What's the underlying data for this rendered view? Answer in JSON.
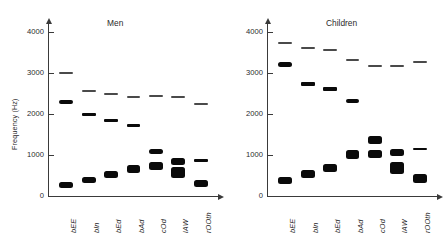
{
  "figure": {
    "ylabel": "Frequency (Hz)",
    "yticks": [
      "0",
      "1000",
      "2000",
      "3000",
      "4000"
    ],
    "ytick_values": [
      0,
      1000,
      2000,
      3000,
      4000
    ],
    "ymin": 0,
    "ymax": 4000,
    "categories": [
      "bEE",
      "bIn",
      "bEd",
      "bAd",
      "cOd",
      "lAW",
      "rOOth"
    ],
    "panels": [
      {
        "title": "Men"
      },
      {
        "title": "Children"
      }
    ]
  },
  "chart_data": {
    "type": "bar",
    "xlabel": "",
    "ylabel": "Frequency (Hz)",
    "ylim": [
      0,
      4000
    ],
    "grid": false,
    "legend": "none",
    "categories": [
      "bEE",
      "bIn",
      "bEd",
      "bAd",
      "cOd",
      "lAW",
      "rOOth"
    ],
    "panels": [
      {
        "title": "Men",
        "series": [
          {
            "name": "F1",
            "values": [
              270,
              390,
              530,
              660,
              730,
              570,
              300
            ]
          },
          {
            "name": "F2",
            "values": [
              2290,
              1990,
              1840,
              1720,
              1090,
              840,
              870
            ]
          },
          {
            "name": "F3",
            "values": [
              3010,
              2550,
              2480,
              2410,
              2440,
              2410,
              2240
            ]
          }
        ],
        "bar_thickness_hz": {
          "F1": [
            150,
            170,
            180,
            180,
            200,
            260,
            160
          ],
          "F2": [
            110,
            90,
            80,
            90,
            130,
            150,
            60
          ],
          "F3": [
            40,
            40,
            40,
            50,
            40,
            40,
            50
          ]
        }
      },
      {
        "title": "Children",
        "series": [
          {
            "name": "F1",
            "values": [
              370,
              530,
              690,
              1010,
              1030,
              680,
              430
            ]
          },
          {
            "name": "F2",
            "values": [
              3200,
              2730,
              2610,
              2320,
              1370,
              1060,
              1140
            ]
          },
          {
            "name": "F3",
            "values": [
              3730,
              3600,
              3570,
              3320,
              3170,
              3180,
              3260
            ]
          }
        ],
        "bar_thickness_hz": {
          "F1": [
            170,
            190,
            200,
            210,
            200,
            280,
            210
          ],
          "F2": [
            120,
            90,
            90,
            110,
            180,
            170,
            60
          ],
          "F3": [
            50,
            50,
            50,
            50,
            50,
            50,
            50
          ]
        }
      }
    ]
  }
}
